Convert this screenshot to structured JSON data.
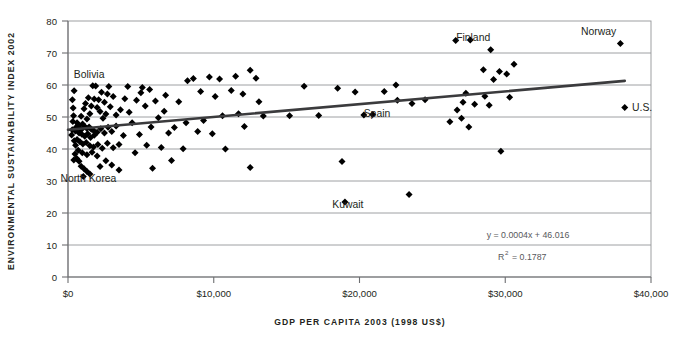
{
  "chart_data": {
    "type": "scatter",
    "title": "",
    "xlabel": "GDP PER CAPITA 2003 (1998 US$)",
    "ylabel": "ENVIRONMENTAL SUSTAINABILITY INDEX 2002",
    "xlim": [
      0,
      40000
    ],
    "ylim": [
      0,
      80
    ],
    "xticks": [
      0,
      10000,
      20000,
      30000,
      40000
    ],
    "xtick_labels": [
      "$0",
      "$10,000",
      "$20,000",
      "$30,000",
      "$40,000"
    ],
    "yticks": [
      0,
      10,
      20,
      30,
      40,
      50,
      60,
      70,
      80
    ],
    "ytick_labels": [
      "0",
      "10",
      "20",
      "30",
      "40",
      "50",
      "60",
      "70",
      "80"
    ],
    "grid": true,
    "grid_axis": "y",
    "legend": "none",
    "point_color": "#000000",
    "marker": "diamond",
    "trendline": {
      "equation": "y = 0.0004x + 46.016",
      "r_squared_label": "R",
      "r_squared_sup": "2",
      "r_squared_value": "= 0.1787",
      "slope": 0.0004,
      "intercept": 46.016,
      "r2": 0.1787,
      "x_start": 0,
      "x_end": 38200,
      "color": "#3b3b3d"
    },
    "annotations": [
      {
        "text": "Bolivia",
        "x": 1450,
        "y": 63.5
      },
      {
        "text": "North Korea",
        "x": 1400,
        "y": 30.8
      },
      {
        "text": "Finland",
        "x": 27800,
        "y": 75.0
      },
      {
        "text": "Norway",
        "x": 36400,
        "y": 77.0
      },
      {
        "text": "Spain",
        "x": 21200,
        "y": 51.2
      },
      {
        "text": "Kuwait",
        "x": 19200,
        "y": 22.8
      },
      {
        "text": "U.S.",
        "x": 38700,
        "y": 53.2
      }
    ],
    "points": [
      {
        "x": 26600,
        "y": 73.9
      },
      {
        "x": 27600,
        "y": 74.1
      },
      {
        "x": 37900,
        "y": 73.0
      },
      {
        "x": 29000,
        "y": 71.0
      },
      {
        "x": 30600,
        "y": 66.5
      },
      {
        "x": 28500,
        "y": 64.8
      },
      {
        "x": 29600,
        "y": 64.2
      },
      {
        "x": 30100,
        "y": 63.4
      },
      {
        "x": 29200,
        "y": 61.7
      },
      {
        "x": 28600,
        "y": 56.5
      },
      {
        "x": 30300,
        "y": 56.2
      },
      {
        "x": 27300,
        "y": 57.4
      },
      {
        "x": 27100,
        "y": 54.6
      },
      {
        "x": 27900,
        "y": 54.0
      },
      {
        "x": 28900,
        "y": 53.7
      },
      {
        "x": 26700,
        "y": 52.2
      },
      {
        "x": 26200,
        "y": 48.5
      },
      {
        "x": 27000,
        "y": 49.6
      },
      {
        "x": 27500,
        "y": 46.9
      },
      {
        "x": 29700,
        "y": 39.3
      },
      {
        "x": 38200,
        "y": 53.0
      },
      {
        "x": 23400,
        "y": 25.8
      },
      {
        "x": 19000,
        "y": 23.4
      },
      {
        "x": 18800,
        "y": 36.1
      },
      {
        "x": 20300,
        "y": 50.6
      },
      {
        "x": 20900,
        "y": 50.8
      },
      {
        "x": 23600,
        "y": 54.2
      },
      {
        "x": 24500,
        "y": 55.4
      },
      {
        "x": 21700,
        "y": 58.0
      },
      {
        "x": 22600,
        "y": 55.2
      },
      {
        "x": 19700,
        "y": 57.8
      },
      {
        "x": 18500,
        "y": 59.0
      },
      {
        "x": 22500,
        "y": 60.0
      },
      {
        "x": 16200,
        "y": 59.6
      },
      {
        "x": 17200,
        "y": 50.5
      },
      {
        "x": 15200,
        "y": 50.4
      },
      {
        "x": 13400,
        "y": 50.3
      },
      {
        "x": 12900,
        "y": 62.1
      },
      {
        "x": 12000,
        "y": 57.2
      },
      {
        "x": 11500,
        "y": 62.7
      },
      {
        "x": 11200,
        "y": 58.3
      },
      {
        "x": 12500,
        "y": 64.6
      },
      {
        "x": 10400,
        "y": 61.9
      },
      {
        "x": 9700,
        "y": 62.5
      },
      {
        "x": 10100,
        "y": 56.4
      },
      {
        "x": 9100,
        "y": 58.0
      },
      {
        "x": 8600,
        "y": 62.0
      },
      {
        "x": 8200,
        "y": 61.3
      },
      {
        "x": 13100,
        "y": 54.8
      },
      {
        "x": 12100,
        "y": 47.0
      },
      {
        "x": 12500,
        "y": 34.2
      },
      {
        "x": 10800,
        "y": 40.0
      },
      {
        "x": 9300,
        "y": 48.9
      },
      {
        "x": 8900,
        "y": 45.5
      },
      {
        "x": 10600,
        "y": 50.4
      },
      {
        "x": 11700,
        "y": 51.0
      },
      {
        "x": 7900,
        "y": 40.1
      },
      {
        "x": 7300,
        "y": 46.7
      },
      {
        "x": 6900,
        "y": 45.0
      },
      {
        "x": 7600,
        "y": 54.8
      },
      {
        "x": 6600,
        "y": 51.8
      },
      {
        "x": 6200,
        "y": 49.8
      },
      {
        "x": 6000,
        "y": 55.0
      },
      {
        "x": 5600,
        "y": 58.6
      },
      {
        "x": 5300,
        "y": 53.4
      },
      {
        "x": 5000,
        "y": 57.6
      },
      {
        "x": 4700,
        "y": 55.2
      },
      {
        "x": 5700,
        "y": 46.9
      },
      {
        "x": 5400,
        "y": 41.2
      },
      {
        "x": 6400,
        "y": 40.5
      },
      {
        "x": 4900,
        "y": 44.5
      },
      {
        "x": 4400,
        "y": 48.2
      },
      {
        "x": 4200,
        "y": 51.5
      },
      {
        "x": 3900,
        "y": 55.7
      },
      {
        "x": 4100,
        "y": 59.5
      },
      {
        "x": 3600,
        "y": 52.3
      },
      {
        "x": 3300,
        "y": 50.6
      },
      {
        "x": 3800,
        "y": 44.2
      },
      {
        "x": 3500,
        "y": 41.4
      },
      {
        "x": 4600,
        "y": 38.8
      },
      {
        "x": 3100,
        "y": 56.4
      },
      {
        "x": 2900,
        "y": 53.2
      },
      {
        "x": 2700,
        "y": 57.2
      },
      {
        "x": 2500,
        "y": 54.6
      },
      {
        "x": 2300,
        "y": 57.7
      },
      {
        "x": 2100,
        "y": 55.4
      },
      {
        "x": 2600,
        "y": 50.9
      },
      {
        "x": 2400,
        "y": 49.6
      },
      {
        "x": 2200,
        "y": 51.7
      },
      {
        "x": 2000,
        "y": 53.0
      },
      {
        "x": 1800,
        "y": 55.6
      },
      {
        "x": 1600,
        "y": 53.4
      },
      {
        "x": 1400,
        "y": 56.0
      },
      {
        "x": 1200,
        "y": 54.2
      },
      {
        "x": 1500,
        "y": 51.0
      },
      {
        "x": 1300,
        "y": 49.4
      },
      {
        "x": 1100,
        "y": 52.6
      },
      {
        "x": 900,
        "y": 50.2
      },
      {
        "x": 2800,
        "y": 59.5
      },
      {
        "x": 1900,
        "y": 59.7
      },
      {
        "x": 1000,
        "y": 47.8
      },
      {
        "x": 1150,
        "y": 47.0
      },
      {
        "x": 1300,
        "y": 46.4
      },
      {
        "x": 1450,
        "y": 46.9
      },
      {
        "x": 1600,
        "y": 46.2
      },
      {
        "x": 1750,
        "y": 45.8
      },
      {
        "x": 900,
        "y": 46.0
      },
      {
        "x": 800,
        "y": 46.6
      },
      {
        "x": 700,
        "y": 47.4
      },
      {
        "x": 620,
        "y": 48.2
      },
      {
        "x": 560,
        "y": 46.8
      },
      {
        "x": 500,
        "y": 45.6
      },
      {
        "x": 760,
        "y": 45.0
      },
      {
        "x": 950,
        "y": 44.6
      },
      {
        "x": 1150,
        "y": 44.0
      },
      {
        "x": 1350,
        "y": 44.8
      },
      {
        "x": 1550,
        "y": 43.6
      },
      {
        "x": 1800,
        "y": 44.3
      },
      {
        "x": 2000,
        "y": 45.2
      },
      {
        "x": 2250,
        "y": 46.3
      },
      {
        "x": 2500,
        "y": 45.0
      },
      {
        "x": 2750,
        "y": 46.8
      },
      {
        "x": 3000,
        "y": 45.5
      },
      {
        "x": 3300,
        "y": 47.2
      },
      {
        "x": 620,
        "y": 43.0
      },
      {
        "x": 820,
        "y": 42.3
      },
      {
        "x": 1020,
        "y": 41.6
      },
      {
        "x": 1250,
        "y": 42.0
      },
      {
        "x": 1500,
        "y": 41.0
      },
      {
        "x": 1750,
        "y": 40.6
      },
      {
        "x": 2050,
        "y": 41.4
      },
      {
        "x": 2350,
        "y": 40.2
      },
      {
        "x": 2700,
        "y": 41.8
      },
      {
        "x": 3100,
        "y": 40.4
      },
      {
        "x": 520,
        "y": 41.2
      },
      {
        "x": 430,
        "y": 42.6
      },
      {
        "x": 700,
        "y": 39.6
      },
      {
        "x": 980,
        "y": 38.8
      },
      {
        "x": 1300,
        "y": 38.2
      },
      {
        "x": 1650,
        "y": 39.0
      },
      {
        "x": 2000,
        "y": 37.8
      },
      {
        "x": 480,
        "y": 38.4
      },
      {
        "x": 600,
        "y": 37.0
      },
      {
        "x": 760,
        "y": 36.2
      },
      {
        "x": 400,
        "y": 36.6
      },
      {
        "x": 900,
        "y": 34.6
      },
      {
        "x": 1100,
        "y": 33.8
      },
      {
        "x": 1300,
        "y": 33.0
      },
      {
        "x": 1500,
        "y": 32.2
      },
      {
        "x": 1050,
        "y": 31.4
      },
      {
        "x": 2200,
        "y": 34.5
      },
      {
        "x": 2600,
        "y": 36.3
      },
      {
        "x": 3000,
        "y": 35.0
      },
      {
        "x": 3500,
        "y": 33.4
      },
      {
        "x": 5800,
        "y": 34.0
      },
      {
        "x": 7100,
        "y": 36.4
      },
      {
        "x": 380,
        "y": 50.4
      },
      {
        "x": 330,
        "y": 48.6
      },
      {
        "x": 290,
        "y": 46.0
      },
      {
        "x": 250,
        "y": 44.4
      },
      {
        "x": 350,
        "y": 52.8
      },
      {
        "x": 300,
        "y": 55.4
      },
      {
        "x": 420,
        "y": 58.2
      },
      {
        "x": 1700,
        "y": 59.8
      },
      {
        "x": 5100,
        "y": 59.2
      },
      {
        "x": 6700,
        "y": 56.8
      },
      {
        "x": 8100,
        "y": 48.2
      },
      {
        "x": 9900,
        "y": 44.8
      }
    ]
  },
  "plot": {
    "left": 68,
    "right": 651,
    "top": 21,
    "bottom": 277
  }
}
